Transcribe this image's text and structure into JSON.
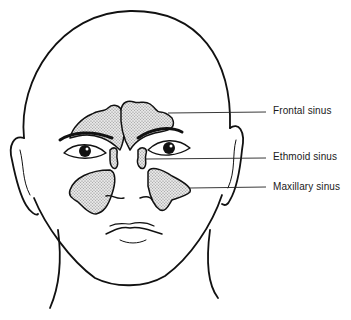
{
  "diagram": {
    "labels": [
      {
        "id": "frontal",
        "text": "Frontal sinus",
        "x": 273,
        "y": 105
      },
      {
        "id": "ethmoid",
        "text": "Ethmoid sinus",
        "x": 273,
        "y": 150
      },
      {
        "id": "maxillary",
        "text": "Maxillary sinus",
        "x": 273,
        "y": 180
      }
    ],
    "colors": {
      "line": "#111111",
      "background": "#ffffff",
      "stipple": "#888888"
    }
  }
}
